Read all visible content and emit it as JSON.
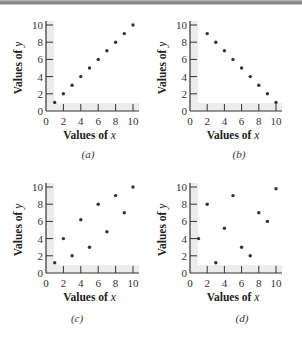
{
  "chart_data": [
    {
      "type": "scatter",
      "panel": "(a)",
      "xlabel": "Values of x",
      "ylabel": "Values of y",
      "xlim": [
        0,
        10
      ],
      "ylim": [
        0,
        10
      ],
      "xticks": [
        0,
        2,
        4,
        6,
        8,
        10
      ],
      "yticks": [
        0,
        2,
        4,
        6,
        8,
        10
      ],
      "grid": false,
      "x": [
        1,
        2,
        3,
        4,
        5,
        6,
        7,
        8,
        9,
        10
      ],
      "y": [
        1,
        2,
        3,
        4,
        5,
        6,
        7,
        8,
        9,
        10
      ]
    },
    {
      "type": "scatter",
      "panel": "(b)",
      "xlabel": "Values of x",
      "ylabel": "Values of y",
      "xlim": [
        0,
        10
      ],
      "ylim": [
        0,
        10
      ],
      "xticks": [
        0,
        2,
        4,
        6,
        8,
        10
      ],
      "yticks": [
        0,
        2,
        4,
        6,
        8,
        10
      ],
      "grid": false,
      "x": [
        2,
        3,
        4,
        5,
        6,
        7,
        8,
        9,
        10
      ],
      "y": [
        9,
        8,
        7,
        6,
        5,
        4,
        3,
        2,
        1
      ]
    },
    {
      "type": "scatter",
      "panel": "(c)",
      "xlabel": "Values of x",
      "ylabel": "Values of y",
      "xlim": [
        0,
        10
      ],
      "ylim": [
        0,
        10
      ],
      "xticks": [
        0,
        2,
        4,
        6,
        8,
        10
      ],
      "yticks": [
        0,
        2,
        4,
        6,
        8,
        10
      ],
      "grid": false,
      "x": [
        1,
        2,
        3,
        4,
        5,
        6,
        7,
        8,
        9,
        10
      ],
      "y": [
        1.2,
        4,
        2,
        6.2,
        3,
        8,
        4.8,
        9,
        7,
        10
      ]
    },
    {
      "type": "scatter",
      "panel": "(d)",
      "xlabel": "Values of x",
      "ylabel": "Values of y",
      "xlim": [
        0,
        10
      ],
      "ylim": [
        0,
        10
      ],
      "xticks": [
        0,
        2,
        4,
        6,
        8,
        10
      ],
      "yticks": [
        0,
        2,
        4,
        6,
        8,
        10
      ],
      "grid": false,
      "x": [
        1,
        2,
        3,
        4,
        5,
        6,
        7,
        8,
        9,
        10
      ],
      "y": [
        4,
        8,
        1.2,
        5.2,
        9,
        3,
        2,
        7,
        6,
        9.8
      ]
    }
  ],
  "labels": {
    "x_title_prefix": "Values of ",
    "x_var": "x",
    "y_title_prefix": "Values of ",
    "y_var": "y"
  },
  "captions": [
    "(a)",
    "(b)",
    "(c)",
    "(d)"
  ],
  "colors": {
    "point": "#333333",
    "axis": "#333333",
    "shade": "#ececec"
  }
}
